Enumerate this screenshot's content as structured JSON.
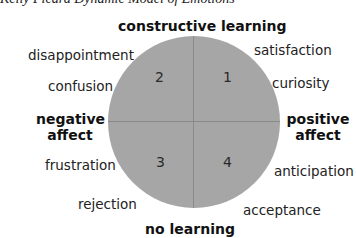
{
  "caption": "Kelly Picard Dynamic Model of Emotions",
  "axes": {
    "top": "constructive learning",
    "bottom": "no learning",
    "left_line1": "negative",
    "left_line2": "affect",
    "right_line1": "positive",
    "right_line2": "affect"
  },
  "quadrants": [
    {
      "number": "1",
      "position": "top-right"
    },
    {
      "number": "2",
      "position": "top-left"
    },
    {
      "number": "3",
      "position": "bottom-left"
    },
    {
      "number": "4",
      "position": "bottom-right"
    }
  ],
  "emotions": {
    "q1": [
      "satisfaction",
      "curiosity"
    ],
    "q2": [
      "disappointment",
      "confusion"
    ],
    "q3": [
      "frustration",
      "rejection"
    ],
    "q4": [
      "anticipation",
      "acceptance"
    ]
  },
  "colors": {
    "circle_fill": "#a6a6a6",
    "divider": "#8a8a8a"
  }
}
